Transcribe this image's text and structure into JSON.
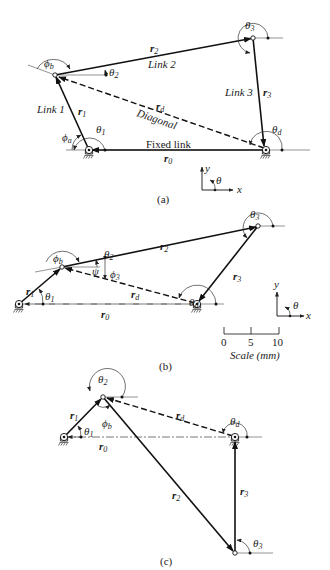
{
  "figure": {
    "panels": [
      {
        "caption": "(a)",
        "labels": {
          "link1": "Link 1",
          "link2": "Link 2",
          "link3": "Link 3",
          "diagonal": "Diagonal",
          "fixed": "Fixed link",
          "r0": "r",
          "r0_sub": "0",
          "r1": "r",
          "r1_sub": "1",
          "r2": "r",
          "r2_sub": "2",
          "r3": "r",
          "r3_sub": "3",
          "rd": "r",
          "rd_sub": "d",
          "theta1": "θ",
          "theta1_sub": "1",
          "theta2": "θ",
          "theta2_sub": "2",
          "theta3": "θ",
          "theta3_sub": "3",
          "thetad": "θ",
          "thetad_sub": "d",
          "phia": "ϕ",
          "phia_sub": "a",
          "phib": "ϕ",
          "phib_sub": "b"
        },
        "axes": {
          "y": "y",
          "x": "x",
          "theta": "θ"
        }
      },
      {
        "caption": "(b)",
        "labels": {
          "r0": "r",
          "r0_sub": "0",
          "r1": "r",
          "r1_sub": "1",
          "r2": "r",
          "r2_sub": "2",
          "r3": "r",
          "r3_sub": "3",
          "rd": "r",
          "rd_sub": "d",
          "theta1": "θ",
          "theta1_sub": "1",
          "theta2": "θ",
          "theta2_sub": "2",
          "theta3": "θ",
          "theta3_sub": "3",
          "thetad": "θ",
          "thetad_sub": "d",
          "phib": "ϕ",
          "phib_sub": "b",
          "phi3": "ϕ",
          "phi3_sub": "3",
          "psi": "ψ"
        },
        "axes": {
          "y": "y",
          "x": "x",
          "theta": "θ"
        },
        "scale": {
          "ticks": [
            "0",
            "5",
            "10"
          ],
          "label": "Scale (mm)"
        }
      },
      {
        "caption": "(c)",
        "labels": {
          "r0": "r",
          "r0_sub": "0",
          "r1": "r",
          "r1_sub": "1",
          "r2": "r",
          "r2_sub": "2",
          "r3": "r",
          "r3_sub": "3",
          "rd": "r",
          "rd_sub": "d",
          "theta1": "θ",
          "theta1_sub": "1",
          "theta2": "θ",
          "theta2_sub": "2",
          "theta3": "θ",
          "theta3_sub": "3",
          "thetad": "θ",
          "thetad_sub": "d",
          "phib": "ϕ",
          "phib_sub": "b"
        }
      }
    ]
  }
}
